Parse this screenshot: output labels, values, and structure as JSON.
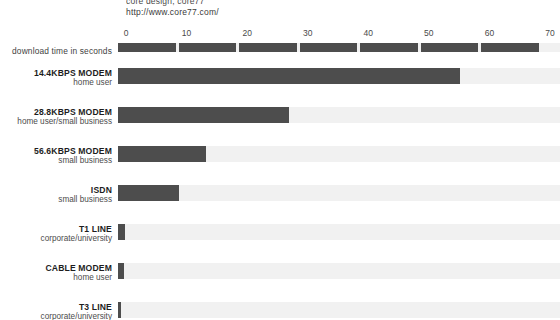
{
  "header": {
    "credit_top": "core design, core77",
    "url": "http://www.core77.com/"
  },
  "axis": {
    "label": "download time in seconds",
    "ticks": [
      "0",
      "10",
      "20",
      "30",
      "40",
      "50",
      "60",
      "70"
    ],
    "min": 0,
    "max": 70,
    "step": 10
  },
  "colors": {
    "bar": "#4d4d4d",
    "track": "#f1f1f1",
    "text": "#1d1d1d",
    "background": "#ffffff"
  },
  "rows": [
    {
      "name": "14.4KBPS MODEM",
      "sub": "home user",
      "value": 56.5
    },
    {
      "name": "28.8KBPS MODEM",
      "sub": "home user/small business",
      "value": 28.3
    },
    {
      "name": "56.6KBPS MODEM",
      "sub": "small business",
      "value": 14.5
    },
    {
      "name": "ISDN",
      "sub": "small business",
      "value": 10.0
    },
    {
      "name": "T1 LINE",
      "sub": "corporate/university",
      "value": 1.1
    },
    {
      "name": "CABLE MODEM",
      "sub": "home user",
      "value": 1.0
    },
    {
      "name": "T3 LINE",
      "sub": "corporate/university",
      "value": 0.5
    }
  ],
  "chart_data": {
    "type": "bar",
    "title": "",
    "orientation": "horizontal",
    "xlabel": "download time in seconds",
    "ylabel": "",
    "xlim": [
      0,
      70
    ],
    "xticks": [
      0,
      10,
      20,
      30,
      40,
      50,
      60,
      70
    ],
    "grid": false,
    "legend": "none",
    "categories": [
      "14.4KBPS MODEM",
      "28.8KBPS MODEM",
      "56.6KBPS MODEM",
      "ISDN",
      "T1 LINE",
      "CABLE MODEM",
      "T3 LINE"
    ],
    "category_subtitles": [
      "home user",
      "home user/small business",
      "small business",
      "small business",
      "corporate/university",
      "home user",
      "corporate/university"
    ],
    "values": [
      56.5,
      28.3,
      14.5,
      10.0,
      1.1,
      1.0,
      0.5
    ],
    "units": "seconds",
    "annotations": [
      "http://www.core77.com/"
    ]
  }
}
